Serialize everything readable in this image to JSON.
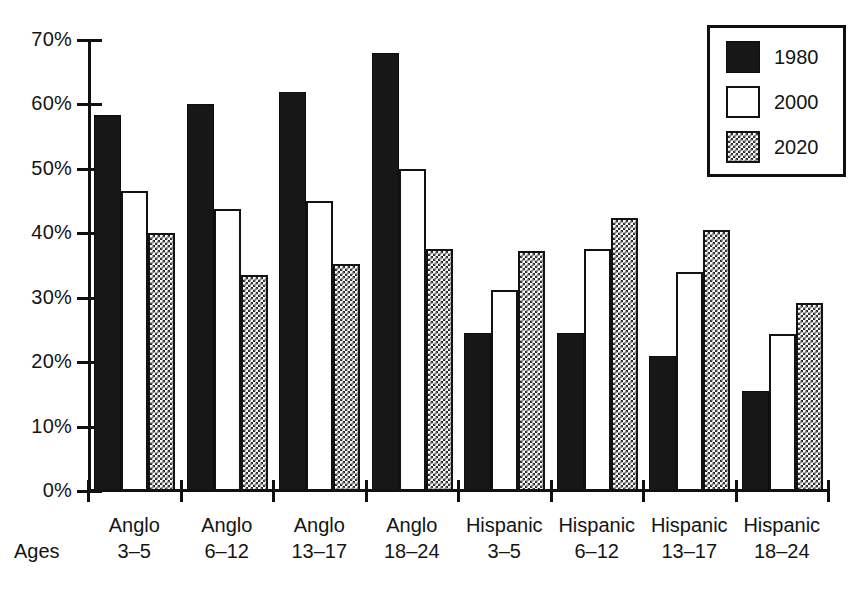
{
  "chart_data": {
    "type": "bar",
    "title": "",
    "xlabel": "Ages",
    "ylabel": "",
    "ylim": [
      0,
      70
    ],
    "grid": false,
    "legend_position": "top-right",
    "y_ticks": [
      "0%",
      "10%",
      "20%",
      "30%",
      "40%",
      "50%",
      "60%",
      "70%"
    ],
    "y_tick_values": [
      0,
      10,
      20,
      30,
      40,
      50,
      60,
      70
    ],
    "categories": [
      "Anglo 3–5",
      "Anglo 6–12",
      "Anglo 13–17",
      "Anglo 18–24",
      "Hispanic 3–5",
      "Hispanic 6–12",
      "Hispanic 13–17",
      "Hispanic 18–24"
    ],
    "category_lines": [
      {
        "line1": "Anglo",
        "line2": "3–5"
      },
      {
        "line1": "Anglo",
        "line2": "6–12"
      },
      {
        "line1": "Anglo",
        "line2": "13–17"
      },
      {
        "line1": "Anglo",
        "line2": "18–24"
      },
      {
        "line1": "Hispanic",
        "line2": "3–5"
      },
      {
        "line1": "Hispanic",
        "line2": "6–12"
      },
      {
        "line1": "Hispanic",
        "line2": "13–17"
      },
      {
        "line1": "Hispanic",
        "line2": "18–24"
      }
    ],
    "series": [
      {
        "name": "1980",
        "style": "solid-black",
        "color": "#171717",
        "values": [
          58.3,
          60.0,
          62.0,
          68.0,
          24.6,
          24.5,
          21.0,
          15.6
        ]
      },
      {
        "name": "2000",
        "style": "white-outline",
        "color": "#ffffff",
        "values": [
          46.6,
          43.7,
          45.0,
          50.0,
          31.2,
          37.6,
          34.0,
          24.3
        ]
      },
      {
        "name": "2020",
        "style": "checkered",
        "color": "#2a2a2a",
        "values": [
          40.1,
          33.5,
          35.2,
          37.6,
          37.3,
          42.4,
          40.5,
          29.2
        ]
      }
    ]
  },
  "legend": {
    "entries": [
      {
        "label": "1980"
      },
      {
        "label": "2000"
      },
      {
        "label": "2020"
      }
    ]
  },
  "axis": {
    "x_label": "Ages"
  }
}
